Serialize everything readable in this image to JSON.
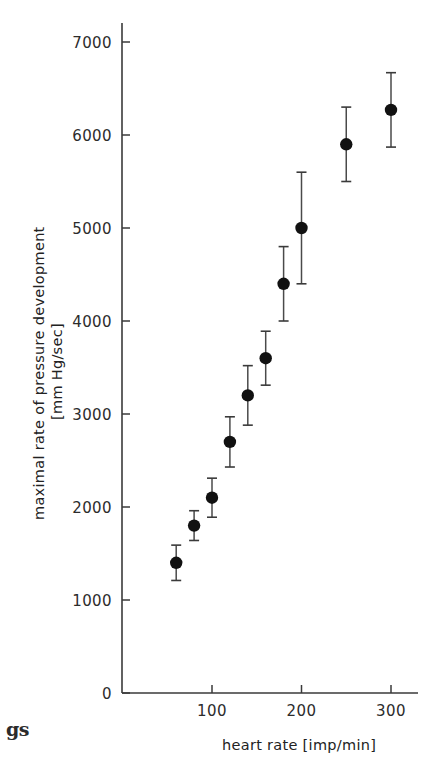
{
  "figure": {
    "background_color": "#ffffff",
    "ink_color": "#1a1a1a",
    "bleed_text": "gs"
  },
  "chart_data": {
    "type": "scatter",
    "title": "",
    "subtitle": "",
    "xlabel": "heart rate [imp/min]",
    "ylabel": "maximal rate  of  pressure development",
    "ylabel_line1": "maximal rate  of  pressure development",
    "ylabel_line2": "[mm Hg/sec]",
    "yunit": "[mm Hg/sec]",
    "xunit": "[imp/min]",
    "xlim": [
      40,
      320
    ],
    "ylim": [
      0,
      7300
    ],
    "xticks": [
      100,
      200,
      300
    ],
    "xtick_labels": [
      "100",
      "200",
      "300"
    ],
    "yticks": [
      0,
      1000,
      2000,
      3000,
      4000,
      5000,
      6000,
      7000
    ],
    "ytick_labels": [
      "0",
      "1000",
      "2000",
      "3000",
      "4000",
      "5000",
      "6000",
      "7000"
    ],
    "grid": false,
    "legend": null,
    "legend_position": "none",
    "error_bars": "symmetric-vertical",
    "marker": "filled-circle",
    "series": [
      {
        "name": "maximal rate of pressure development",
        "x": [
          60,
          80,
          100,
          120,
          140,
          160,
          180,
          200,
          250,
          300
        ],
        "y": [
          1400,
          1800,
          2100,
          2700,
          3200,
          3600,
          4400,
          5000,
          5900,
          6270
        ],
        "yerr": [
          190,
          160,
          210,
          270,
          320,
          290,
          400,
          600,
          400,
          400
        ]
      }
    ],
    "points": [
      {
        "x": 60,
        "y": 1400,
        "yerr": 190,
        "ylow": 1210,
        "yhigh": 1590
      },
      {
        "x": 80,
        "y": 1800,
        "yerr": 160,
        "ylow": 1640,
        "yhigh": 1960
      },
      {
        "x": 100,
        "y": 2100,
        "yerr": 210,
        "ylow": 1890,
        "yhigh": 2310
      },
      {
        "x": 120,
        "y": 2700,
        "yerr": 270,
        "ylow": 2430,
        "yhigh": 2970
      },
      {
        "x": 140,
        "y": 3200,
        "yerr": 320,
        "ylow": 2880,
        "yhigh": 3520
      },
      {
        "x": 160,
        "y": 3600,
        "yerr": 290,
        "ylow": 3310,
        "yhigh": 3890
      },
      {
        "x": 180,
        "y": 4400,
        "yerr": 400,
        "ylow": 4000,
        "yhigh": 4800
      },
      {
        "x": 200,
        "y": 5000,
        "yerr": 600,
        "ylow": 4400,
        "yhigh": 5600
      },
      {
        "x": 250,
        "y": 5900,
        "yerr": 400,
        "ylow": 5500,
        "yhigh": 6300
      },
      {
        "x": 300,
        "y": 6270,
        "yerr": 400,
        "ylow": 5870,
        "yhigh": 6670
      }
    ]
  }
}
